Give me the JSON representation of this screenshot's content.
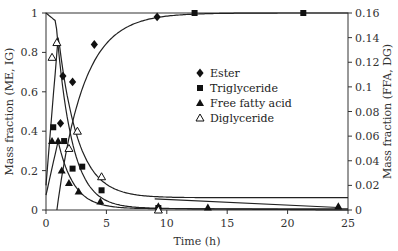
{
  "chart_data": {
    "type": "scatter",
    "title": "",
    "xlabel": "Time (h)",
    "ylabel": "Mass fraction (ME, IG)",
    "ylabel_right": "Mass fraction (FFA, DG)",
    "xlim": [
      0,
      25
    ],
    "ylim": [
      0,
      1
    ],
    "ylim_right": [
      0,
      0.16
    ],
    "x_ticks": [
      "0",
      "5",
      "10",
      "15",
      "20",
      "25"
    ],
    "y_ticks": [
      "0",
      "0.2",
      "0.4",
      "0.6",
      "0.8",
      "1"
    ],
    "y_ticks_right": [
      "0",
      "0.02",
      "0.04",
      "0.06",
      "0.08",
      "0.1",
      "0.12",
      "0.14",
      "0.16"
    ],
    "grid": false,
    "legend_position": "center-right",
    "series": [
      {
        "name": "Ester",
        "marker": "filled-diamond",
        "axis": "left",
        "x": [
          1.2,
          1.4,
          2.2,
          4.0,
          9.2
        ],
        "y": [
          0.44,
          0.68,
          0.65,
          0.84,
          0.98
        ]
      },
      {
        "name": "Triglyceride",
        "marker": "filled-square",
        "axis": "left",
        "x": [
          0.6,
          1.5,
          2.2,
          3.0,
          4.6,
          9.3,
          12.3,
          21.3
        ],
        "y": [
          0.42,
          0.35,
          0.21,
          0.22,
          0.1,
          0.01,
          1.0,
          1.0
        ]
      },
      {
        "name": "Free fatty acid",
        "marker": "filled-triangle",
        "axis": "right",
        "x": [
          0.5,
          1.0,
          1.3,
          1.9,
          2.7,
          4.5,
          9.3,
          13.4,
          24.2
        ],
        "y": [
          0.056,
          0.056,
          0.032,
          0.022,
          0.015,
          0.007,
          0.003,
          0.002,
          0.003
        ]
      },
      {
        "name": "Diglyceride",
        "marker": "open-triangle",
        "axis": "right",
        "x": [
          0.5,
          0.9,
          1.9,
          2.6,
          4.6,
          9.3
        ],
        "y": [
          0.124,
          0.136,
          0.05,
          0.064,
          0.027,
          0.0
        ]
      }
    ]
  }
}
